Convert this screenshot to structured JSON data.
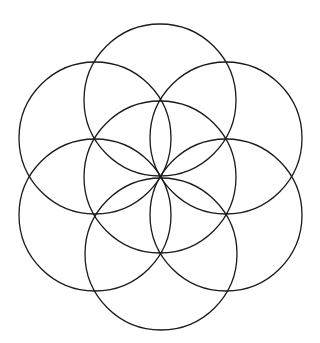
{
  "diagram": {
    "title": "",
    "pattern": "seed-of-life",
    "stroke_color": "#1a1a1a",
    "background": "#ffffff",
    "radius": 76,
    "circles": [
      {
        "name": "center",
        "cx": 160,
        "cy": 177
      },
      {
        "name": "top",
        "cx": 160,
        "cy": 100
      },
      {
        "name": "upper-right",
        "cx": 226,
        "cy": 138
      },
      {
        "name": "lower-right",
        "cx": 226,
        "cy": 215
      },
      {
        "name": "bottom",
        "cx": 161,
        "cy": 254
      },
      {
        "name": "lower-left",
        "cx": 95,
        "cy": 215
      },
      {
        "name": "upper-left",
        "cx": 95,
        "cy": 138
      }
    ]
  }
}
